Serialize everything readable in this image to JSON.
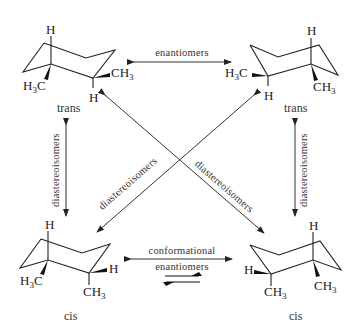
{
  "diagram": {
    "molecules": [
      {
        "id": "top-left",
        "labels": {
          "axial_top": "H",
          "left_sub": "H3C",
          "right_sub": "CH3",
          "right_bottom": "H"
        },
        "caption": "trans"
      },
      {
        "id": "top-right",
        "labels": {
          "axial_top": "H",
          "left_sub": "H3C",
          "right_sub": "CH3",
          "left_bottom": "H"
        },
        "caption": "trans"
      },
      {
        "id": "bottom-left",
        "labels": {
          "axial_top": "H",
          "left_sub": "H3C",
          "right_sub": "H",
          "right_bottom": "CH3"
        },
        "caption": "cis"
      },
      {
        "id": "bottom-right",
        "labels": {
          "axial_top": "H",
          "left_sub": "H",
          "right_sub": "CH3",
          "left_bottom": "CH3"
        },
        "caption": "cis"
      }
    ],
    "relations": {
      "top": "enantiomers",
      "left": "diastereoisomers",
      "right": "diastereoisomers",
      "diag_1": "diastereoisomers",
      "diag_2": "diastereoisomers",
      "bottom_line1": "conformational",
      "bottom_line2": "enantiomers"
    },
    "colors": {
      "ink": "#222222",
      "background": "#ffffff"
    }
  }
}
